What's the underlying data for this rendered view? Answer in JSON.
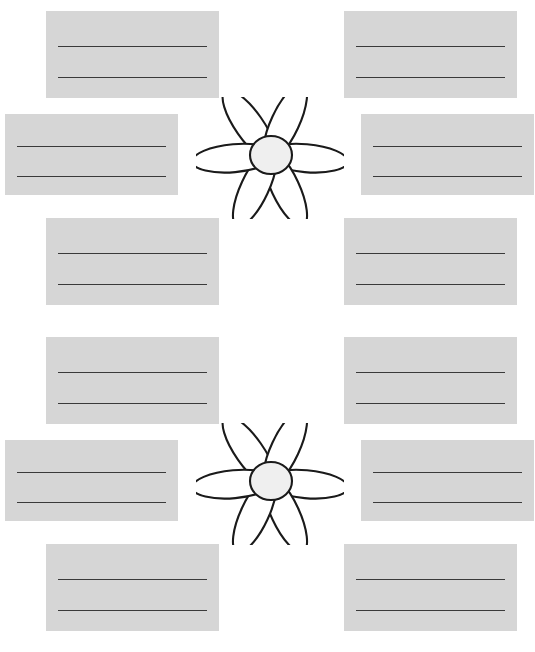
{
  "page": {
    "background_color": "#ffffff",
    "width": 535,
    "height": 652
  },
  "style": {
    "box_fill": "#d6d6d6",
    "writing_line_color": "#3a3a3a",
    "flower_outline_color": "#1a1a1a",
    "flower_petal_fill": "#ffffff",
    "flower_center_fill": "#efefef"
  },
  "sections": [
    {
      "name": "organizer-top",
      "flower": {
        "name": "daisy-flower-top",
        "petal_count": 6,
        "center_label": "",
        "petal_labels": [
          "",
          "",
          "",
          "",
          "",
          ""
        ]
      },
      "boxes": [
        {
          "name": "box-top-left",
          "position": "top-left",
          "line_1": "",
          "line_2": ""
        },
        {
          "name": "box-top-right",
          "position": "top-right",
          "line_1": "",
          "line_2": ""
        },
        {
          "name": "box-middle-left",
          "position": "middle-left",
          "line_1": "",
          "line_2": ""
        },
        {
          "name": "box-middle-right",
          "position": "middle-right",
          "line_1": "",
          "line_2": ""
        },
        {
          "name": "box-bottom-left",
          "position": "bottom-left",
          "line_1": "",
          "line_2": ""
        },
        {
          "name": "box-bottom-right",
          "position": "bottom-right",
          "line_1": "",
          "line_2": ""
        }
      ]
    },
    {
      "name": "organizer-bottom",
      "flower": {
        "name": "daisy-flower-bottom",
        "petal_count": 6,
        "center_label": "",
        "petal_labels": [
          "",
          "",
          "",
          "",
          "",
          ""
        ]
      },
      "boxes": [
        {
          "name": "box-top-left",
          "position": "top-left",
          "line_1": "",
          "line_2": ""
        },
        {
          "name": "box-top-right",
          "position": "top-right",
          "line_1": "",
          "line_2": ""
        },
        {
          "name": "box-middle-left",
          "position": "middle-left",
          "line_1": "",
          "line_2": ""
        },
        {
          "name": "box-middle-right",
          "position": "middle-right",
          "line_1": "",
          "line_2": ""
        },
        {
          "name": "box-bottom-left",
          "position": "bottom-left",
          "line_1": "",
          "line_2": ""
        },
        {
          "name": "box-bottom-right",
          "position": "bottom-right",
          "line_1": "",
          "line_2": ""
        }
      ]
    }
  ]
}
